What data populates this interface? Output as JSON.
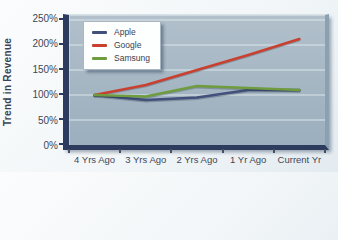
{
  "chart_data": {
    "type": "line",
    "ylabel": "Trend in Revenue",
    "categories": [
      "4 Yrs Ago",
      "3 Yrs Ago",
      "2 Yrs Ago",
      "1 Yr Ago",
      "Current Yr"
    ],
    "series": [
      {
        "name": "Apple",
        "color": "#42507c",
        "values": [
          100,
          90,
          95,
          110,
          110
        ]
      },
      {
        "name": "Google",
        "color": "#c9402f",
        "values": [
          100,
          120,
          150,
          180,
          212
        ]
      },
      {
        "name": "Samsung",
        "color": "#6f9c3f",
        "values": [
          100,
          97,
          118,
          114,
          110
        ]
      }
    ],
    "y_ticks": [
      {
        "value": 250,
        "label": "250%"
      },
      {
        "value": 200,
        "label": "200%"
      },
      {
        "value": 150,
        "label": "150%"
      },
      {
        "value": 100,
        "label": "100%"
      },
      {
        "value": 50,
        "label": "50%"
      },
      {
        "value": 0,
        "label": "0%"
      }
    ],
    "ylim": [
      0,
      250
    ],
    "grid": true,
    "legend_position": "top-left"
  },
  "colors": {
    "panel_top": "#b1c0cb",
    "panel_bottom": "#9cafbe",
    "axis_bar": "#2d3b5e",
    "gridline": "#e2eaef",
    "text": "#3d4756"
  }
}
